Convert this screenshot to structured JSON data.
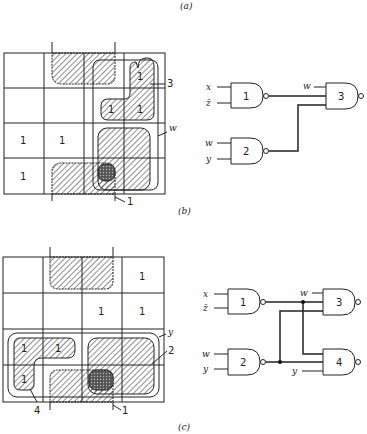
{
  "captions": {
    "a": "(a)",
    "b": "(b)",
    "c": "(c)"
  },
  "figure_b": {
    "kmap": {
      "cells": [
        [
          "",
          "",
          "",
          ""
        ],
        [
          "",
          "",
          "1",
          "1"
        ],
        [
          "1",
          "1",
          "",
          ""
        ],
        [
          "1",
          "",
          "",
          ""
        ]
      ],
      "top_cell_ones": [
        {
          "row": 0,
          "col": 3,
          "label": "1"
        }
      ],
      "group_labels": {
        "g3": "3",
        "gw": "w",
        "g1": "1"
      }
    },
    "circuit": {
      "gates": [
        {
          "id": "1",
          "inputs": [
            "x",
            "z̄"
          ]
        },
        {
          "id": "2",
          "inputs": [
            "w",
            "y"
          ]
        },
        {
          "id": "3",
          "inputs": [
            "w",
            "out1",
            "out2"
          ]
        }
      ],
      "labels": {
        "x": "x",
        "zbar": "z̄",
        "w_in3": "w",
        "w": "w",
        "y": "y",
        "g1": "1",
        "g2": "2",
        "g3": "3"
      }
    }
  },
  "figure_c": {
    "kmap": {
      "cells": [
        [
          "",
          "",
          "",
          "1"
        ],
        [
          "",
          "",
          "1",
          "1"
        ],
        [
          "1",
          "1",
          "",
          ""
        ],
        [
          "1",
          "",
          "",
          ""
        ]
      ],
      "group_labels": {
        "y": "y",
        "g2": "2",
        "g4": "4",
        "g1": "1"
      }
    },
    "circuit": {
      "gates": [
        {
          "id": "1",
          "inputs": [
            "x",
            "z̄"
          ]
        },
        {
          "id": "2",
          "inputs": [
            "w",
            "y"
          ]
        },
        {
          "id": "3",
          "inputs": [
            "w",
            "out1",
            "out2"
          ]
        },
        {
          "id": "4",
          "inputs": [
            "out1",
            "out2",
            "y"
          ]
        }
      ],
      "labels": {
        "x": "x",
        "zbar": "z̄",
        "w_in3": "w",
        "w": "w",
        "y": "y",
        "y_in4": "y",
        "g1": "1",
        "g2": "2",
        "g3": "3",
        "g4": "4"
      }
    }
  }
}
